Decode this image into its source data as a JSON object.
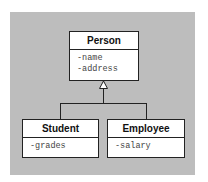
{
  "diagram": {
    "type": "uml-class-inheritance",
    "classes": [
      {
        "name": "Person",
        "attributes": [
          "-name",
          "-address"
        ]
      },
      {
        "name": "Student",
        "attributes": [
          "-grades"
        ]
      },
      {
        "name": "Employee",
        "attributes": [
          "-salary"
        ]
      }
    ],
    "relations": [
      {
        "from": "Student",
        "to": "Person",
        "kind": "generalization"
      },
      {
        "from": "Employee",
        "to": "Person",
        "kind": "generalization"
      }
    ],
    "colors": {
      "background": "#bdbdbd",
      "box": "#ffffff",
      "stroke": "#222222"
    }
  }
}
